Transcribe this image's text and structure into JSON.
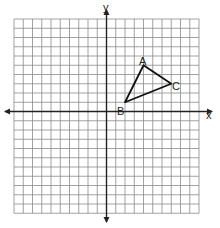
{
  "diagram": {
    "type": "coordinate-plane",
    "axes": {
      "x_label": "x",
      "y_label": "y"
    },
    "grid": {
      "x_min": -10,
      "x_max": 10,
      "y_min": -11,
      "y_max": 10,
      "step": 1
    },
    "triangle": {
      "vertices": [
        {
          "label": "A",
          "x": 4,
          "y": 5
        },
        {
          "label": "B",
          "x": 2,
          "y": 1
        },
        {
          "label": "C",
          "x": 7,
          "y": 3
        }
      ]
    },
    "colors": {
      "grid": "#8a8a8a",
      "axis": "#222222",
      "triangle": "#111111",
      "background": "#ffffff"
    }
  }
}
